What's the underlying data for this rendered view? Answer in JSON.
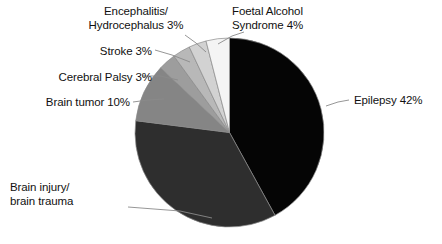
{
  "chart_data": {
    "type": "pie",
    "title": "",
    "subtitle": "",
    "xlabel": "",
    "ylabel": "",
    "legend_position": "none",
    "grid": false,
    "labels_show_percent": true,
    "start_angle_deg": 0,
    "direction": "clockwise",
    "categories": [
      "Epilepsy",
      "Brain injury/brain trauma",
      "Brain tumor",
      "Cerebral Palsy",
      "Stroke",
      "Encephalitis/Hydrocephalus",
      "Foetal Alcohol Syndrome"
    ],
    "values": [
      42,
      35,
      10,
      3,
      3,
      3,
      4
    ],
    "slices": [
      {
        "name": "Epilepsy",
        "value": 42,
        "percent_text": "42%",
        "color": "#050505"
      },
      {
        "name": "Brain injury/brain trauma",
        "value": 35,
        "percent_text": "",
        "color": "#2e2e2e"
      },
      {
        "name": "Brain tumor",
        "value": 10,
        "percent_text": "10%",
        "color": "#858585"
      },
      {
        "name": "Cerebral Palsy",
        "value": 3,
        "percent_text": "3%",
        "color": "#9d9d9d"
      },
      {
        "name": "Stroke",
        "value": 3,
        "percent_text": "3%",
        "color": "#b8b8b8"
      },
      {
        "name": "Encephalitis/Hydrocephalus",
        "value": 3,
        "percent_text": "3%",
        "color": "#d2d2d2"
      },
      {
        "name": "Foetal Alcohol Syndrome",
        "value": 4,
        "percent_text": "4%",
        "color": "#f4f4f4"
      }
    ]
  },
  "labels": {
    "foetal_alcohol_line1": "Foetal Alcohol",
    "foetal_alcohol_line2": "Syndrome 4%",
    "encephalitis_line1": "Encephalitis/",
    "encephalitis_line2": "Hydrocephalus 3%",
    "stroke": "Stroke 3%",
    "cerebral_palsy": "Cerebral Palsy 3%",
    "brain_tumor": "Brain tumor 10%",
    "brain_injury_line1": "Brain injury/",
    "brain_injury_line2": "brain trauma",
    "epilepsy": "Epilepsy 42%"
  },
  "style": {
    "background": "#ffffff",
    "text_color": "#111111",
    "leader_line_color": "#8a8a8a",
    "slice_outline_color": "#8a8a8a"
  }
}
